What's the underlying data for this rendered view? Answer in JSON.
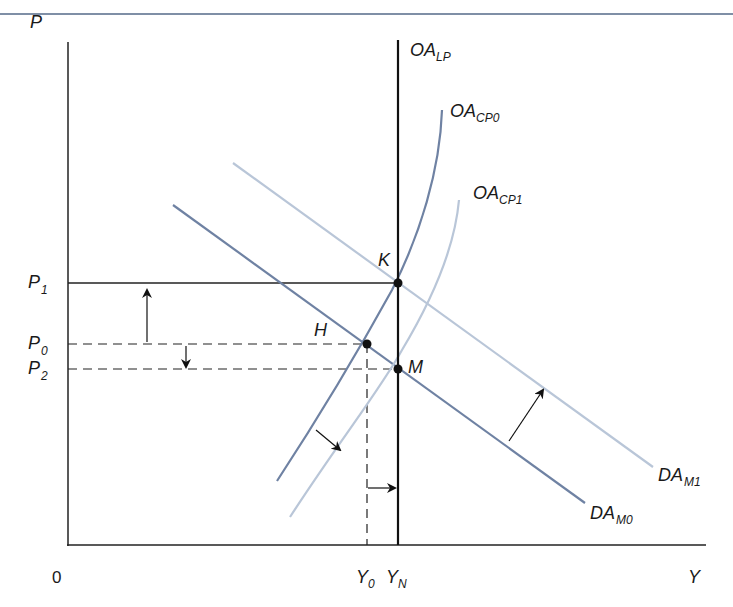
{
  "diagram": {
    "axes": {
      "y_label": "P",
      "x_label": "Y",
      "origin_label": "0"
    },
    "price_levels": [
      {
        "name": "P",
        "sub": "1",
        "y": 283,
        "style": "solid"
      },
      {
        "name": "P",
        "sub": "0",
        "y": 344,
        "style": "dashed"
      },
      {
        "name": "P",
        "sub": "2",
        "y": 369,
        "style": "dashed"
      }
    ],
    "output_levels": [
      {
        "name": "Y",
        "sub": "0",
        "x": 367,
        "style": "dashed"
      },
      {
        "name": "Y",
        "sub": "N",
        "x": 398,
        "style": "solid"
      }
    ],
    "curves": [
      {
        "id": "oa_lp",
        "name": "OA",
        "sub": "LP",
        "color": "#111111",
        "type": "vertical"
      },
      {
        "id": "oa_cp0",
        "name": "OA",
        "sub": "CP0",
        "color": "#6f82a3",
        "type": "supply"
      },
      {
        "id": "oa_cp1",
        "name": "OA",
        "sub": "CP1",
        "color": "#b9c6d8",
        "type": "supply"
      },
      {
        "id": "da_m0",
        "name": "DA",
        "sub": "M0",
        "color": "#6f82a3",
        "type": "demand"
      },
      {
        "id": "da_m1",
        "name": "DA",
        "sub": "M1",
        "color": "#b9c6d8",
        "type": "demand"
      }
    ],
    "points": [
      {
        "label": "K",
        "x": 398,
        "y": 283
      },
      {
        "label": "H",
        "x": 367,
        "y": 344
      },
      {
        "label": "M",
        "x": 398,
        "y": 369
      }
    ],
    "arrows": [
      {
        "desc": "price rises P0 to P1",
        "direction": "up"
      },
      {
        "desc": "price falls P0 to P2",
        "direction": "down"
      },
      {
        "desc": "demand shift DA_M0 to DA_M1",
        "direction": "up-right"
      },
      {
        "desc": "short-run supply shift OA_CP0 to OA_CP1",
        "direction": "down-right"
      },
      {
        "desc": "output Y0 to YN",
        "direction": "right"
      }
    ]
  }
}
